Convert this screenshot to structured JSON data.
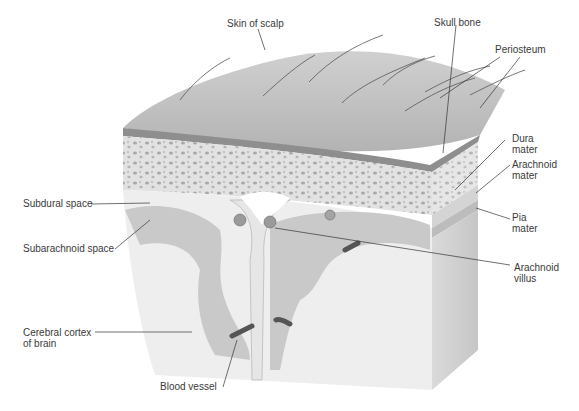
{
  "diagram": {
    "labels": {
      "skin_of_scalp": "Skin of scalp",
      "skull_bone": "Skull bone",
      "periosteum": "Periosteum",
      "dura_mater": "Dura\nmater",
      "arachnoid_mater": "Arachnoid\nmater",
      "pia_mater": "Pia\nmater",
      "arachnoid_villus": "Arachnoid\nvillus",
      "subdural_space": "Subdural space",
      "subarachnoid_space": "Subarachnoid space",
      "cerebral_cortex": "Cerebral cortex\nof brain",
      "blood_vessel": "Blood vessel"
    },
    "colors": {
      "scalp": "#bdbdbd",
      "scalp_dark_band": "#8e8e8e",
      "bone": "#dcdcdc",
      "bone_pores": "#a9a9a9",
      "brain_gray": "#c9c9c9",
      "brain_white": "#eeeeee",
      "leader_line": "#333333",
      "text": "#3a3a3a"
    }
  }
}
